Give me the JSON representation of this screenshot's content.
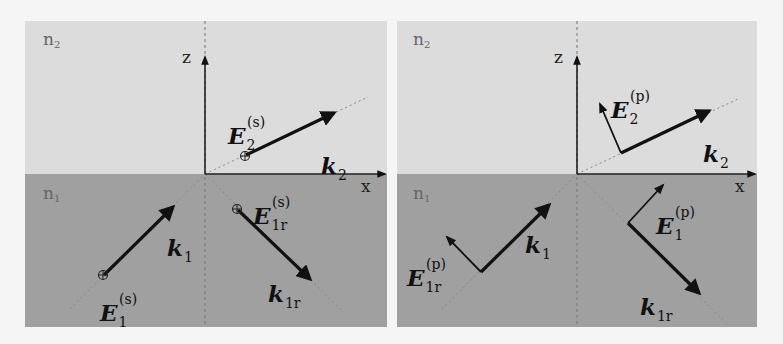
{
  "colors": {
    "background": "#f5f5f5",
    "medium_n2": "#dcdcdc",
    "medium_n1": "#a0a0a0",
    "vector": "#111111",
    "guide_dash": "#808080"
  },
  "panels": [
    {
      "id": "s-polarization",
      "medium_top": "n",
      "medium_top_sub": "2",
      "medium_bottom": "n",
      "medium_bottom_sub": "1",
      "axis_z": "z",
      "axis_x": "x",
      "E2": {
        "base": "E",
        "sub": "2",
        "sup": "(s)",
        "symbol": "circle-plus (into page)"
      },
      "k2": {
        "base": "k",
        "sub": "2"
      },
      "k1": {
        "base": "k",
        "sub": "1"
      },
      "E1": {
        "base": "E",
        "sub": "1",
        "sup": "(s)",
        "symbol": "circle-plus (into page)"
      },
      "E1r": {
        "base": "E",
        "sub": "1r",
        "sup": "(s)",
        "symbol": "circle-plus (into page)"
      },
      "k1r": {
        "base": "k",
        "sub": "1r"
      }
    },
    {
      "id": "p-polarization",
      "medium_top": "n",
      "medium_top_sub": "2",
      "medium_bottom": "n",
      "medium_bottom_sub": "1",
      "axis_z": "z",
      "axis_x": "x",
      "E2": {
        "base": "E",
        "sub": "2",
        "sup": "(p)"
      },
      "k2": {
        "base": "k",
        "sub": "2"
      },
      "k1": {
        "base": "k",
        "sub": "1"
      },
      "E1r": {
        "base": "E",
        "sub": "1r",
        "sup": "(p)"
      },
      "E1": {
        "base": "E",
        "sub": "1",
        "sup": "(p)"
      },
      "k1r": {
        "base": "k",
        "sub": "1r"
      }
    }
  ]
}
